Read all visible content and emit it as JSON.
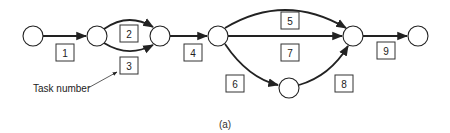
{
  "diagram": {
    "type": "activity-on-arrow network",
    "caption": "(a)",
    "annotation": "Task number",
    "nodes": [
      {
        "id": "n1",
        "x": 33,
        "y": 36
      },
      {
        "id": "n2",
        "x": 97,
        "y": 36
      },
      {
        "id": "n3",
        "x": 160,
        "y": 36
      },
      {
        "id": "n4",
        "x": 218,
        "y": 36
      },
      {
        "id": "n5",
        "x": 353,
        "y": 36
      },
      {
        "id": "n6",
        "x": 289,
        "y": 88
      },
      {
        "id": "n7",
        "x": 418,
        "y": 36
      }
    ],
    "tasks": [
      {
        "label": "1",
        "from": "n1",
        "to": "n2"
      },
      {
        "label": "2",
        "from": "n2",
        "to": "n3"
      },
      {
        "label": "3",
        "from": "n2",
        "to": "n3"
      },
      {
        "label": "4",
        "from": "n3",
        "to": "n4"
      },
      {
        "label": "5",
        "from": "n4",
        "to": "n5"
      },
      {
        "label": "6",
        "from": "n4",
        "to": "n6"
      },
      {
        "label": "7",
        "from": "n4",
        "to": "n5"
      },
      {
        "label": "8",
        "from": "n6",
        "to": "n5"
      },
      {
        "label": "9",
        "from": "n5",
        "to": "n7"
      }
    ]
  }
}
